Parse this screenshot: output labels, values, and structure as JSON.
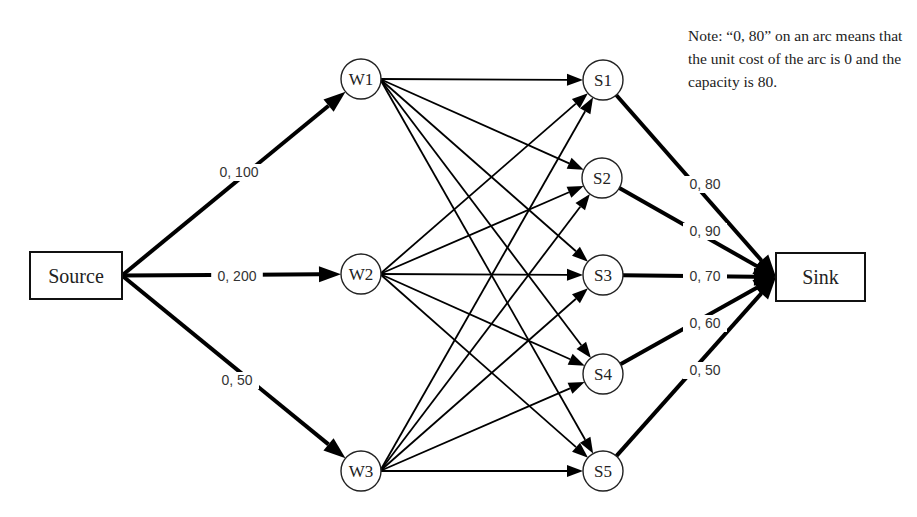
{
  "diagram": {
    "type": "network-flow",
    "note": "Note: “0, 80” on an arc means that the unit cost of the arc is 0 and the capacity is 80.",
    "source": {
      "id": "source",
      "label": "Source",
      "x": 30,
      "y": 252,
      "w": 92,
      "h": 47
    },
    "sink": {
      "id": "sink",
      "label": "Sink",
      "x": 776,
      "y": 253,
      "w": 89,
      "h": 48
    },
    "warehouses": [
      {
        "id": "W1",
        "label": "W1",
        "cx": 361,
        "cy": 79
      },
      {
        "id": "W2",
        "label": "W2",
        "cx": 361,
        "cy": 274
      },
      {
        "id": "W3",
        "label": "W3",
        "cx": 361,
        "cy": 471
      }
    ],
    "stores": [
      {
        "id": "S1",
        "label": "S1",
        "cx": 603,
        "cy": 80
      },
      {
        "id": "S2",
        "label": "S2",
        "cx": 602,
        "cy": 178
      },
      {
        "id": "S3",
        "label": "S3",
        "cx": 603,
        "cy": 275
      },
      {
        "id": "S4",
        "label": "S4",
        "cx": 603,
        "cy": 374
      },
      {
        "id": "S5",
        "label": "S5",
        "cx": 603,
        "cy": 471
      }
    ],
    "node_radius": 20,
    "source_arcs": [
      {
        "to": "W1",
        "label": "0, 100",
        "lx": 239,
        "ly": 176
      },
      {
        "to": "W2",
        "label": "0, 200",
        "lx": 237,
        "ly": 280
      },
      {
        "to": "W3",
        "label": "0, 50",
        "lx": 237,
        "ly": 384
      }
    ],
    "sink_arcs": [
      {
        "from": "S1",
        "label": "0, 80",
        "lx": 705,
        "ly": 188
      },
      {
        "from": "S2",
        "label": "0, 90",
        "lx": 705,
        "ly": 235
      },
      {
        "from": "S3",
        "label": "0, 70",
        "lx": 705,
        "ly": 280
      },
      {
        "from": "S4",
        "label": "0, 60",
        "lx": 705,
        "ly": 327
      },
      {
        "from": "S5",
        "label": "0, 50",
        "lx": 705,
        "ly": 374
      }
    ],
    "transship_arcs": "every warehouse W1..W3 connects to every store S1..S5 (15 arcs)"
  }
}
